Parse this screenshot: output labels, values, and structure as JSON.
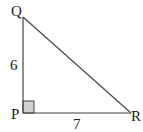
{
  "diagram": {
    "type": "right-triangle",
    "vertices": [
      {
        "label": "Q",
        "x": 23,
        "y": 17
      },
      {
        "label": "P",
        "x": 23,
        "y": 113
      },
      {
        "label": "R",
        "x": 131,
        "y": 113
      }
    ],
    "sides": [
      {
        "from": "P",
        "to": "Q",
        "length_label": "6"
      },
      {
        "from": "P",
        "to": "R",
        "length_label": "7"
      },
      {
        "from": "Q",
        "to": "R",
        "length_label": ""
      }
    ],
    "right_angle_at": "P",
    "colors": {
      "stroke": "#444444",
      "right_angle_fill": "#d0d0d0",
      "text": "#222222"
    }
  }
}
